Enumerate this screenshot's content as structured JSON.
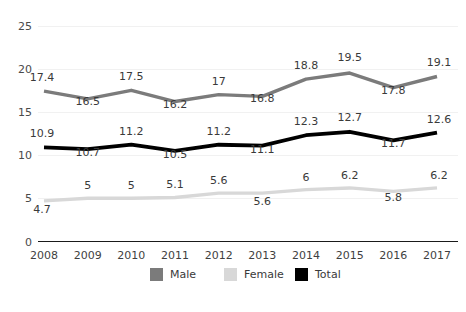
{
  "chart_data": {
    "type": "line",
    "title": "",
    "subtitle": "",
    "xlabel": "",
    "ylabel": "",
    "categories": [
      "2008",
      "2009",
      "2010",
      "2011",
      "2012",
      "2013",
      "2014",
      "2015",
      "2016",
      "2017"
    ],
    "ylim": [
      0,
      25
    ],
    "yticks": [
      "0",
      "5",
      "10",
      "15",
      "20",
      "25"
    ],
    "ytick_values": [
      0,
      5,
      10,
      15,
      20,
      25
    ],
    "grid": true,
    "grid_axis": "y",
    "legend_position": "bottom-center",
    "series": [
      {
        "name": "Male",
        "color": "#7b7b7b",
        "values": [
          17.4,
          16.5,
          17.5,
          16.2,
          17,
          16.8,
          18.8,
          19.5,
          17.8,
          19.1
        ],
        "labels": [
          "17.4",
          "16.5",
          "17.5",
          "16.2",
          "17",
          "16.8",
          "18.8",
          "19.5",
          "17.8",
          "19.1"
        ]
      },
      {
        "name": "Female",
        "color": "#d8d8d8",
        "values": [
          4.7,
          5,
          5,
          5.1,
          5.6,
          5.6,
          6,
          6.2,
          5.8,
          6.2
        ],
        "labels": [
          "4.7",
          "5",
          "5",
          "5.1",
          "5.6",
          "5.6",
          "6",
          "6.2",
          "5.8",
          "6.2"
        ]
      },
      {
        "name": "Total",
        "color": "#000000",
        "values": [
          10.9,
          10.7,
          11.2,
          10.5,
          11.2,
          11.1,
          12.3,
          12.7,
          11.7,
          12.6
        ],
        "labels": [
          "10.9",
          "10.7",
          "11.2",
          "10.5",
          "11.2",
          "11.1",
          "12.3",
          "12.7",
          "11.7",
          "12.6"
        ]
      }
    ]
  },
  "legend": {
    "items": [
      {
        "label": "Male",
        "color": "#7b7b7b"
      },
      {
        "label": "Female",
        "color": "#d8d8d8"
      },
      {
        "label": "Total",
        "color": "#000000"
      }
    ]
  },
  "colors": {
    "background": "#ffffff",
    "gridline": "#f1f1f1",
    "axis": "#1a1a1a",
    "text": "#3a3a3a"
  }
}
